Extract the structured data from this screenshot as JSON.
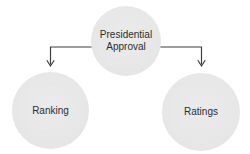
{
  "figure": {
    "background_color": "#ffffff",
    "node_fill_color": "#e8e8e8",
    "connector_color": "#3f3f3f",
    "text_color": "#2d2d2d",
    "root_node": {
      "label": "Presidential Approval"
    },
    "child_nodes": [
      {
        "label": "Ranking"
      },
      {
        "label": "Ratings"
      }
    ]
  }
}
